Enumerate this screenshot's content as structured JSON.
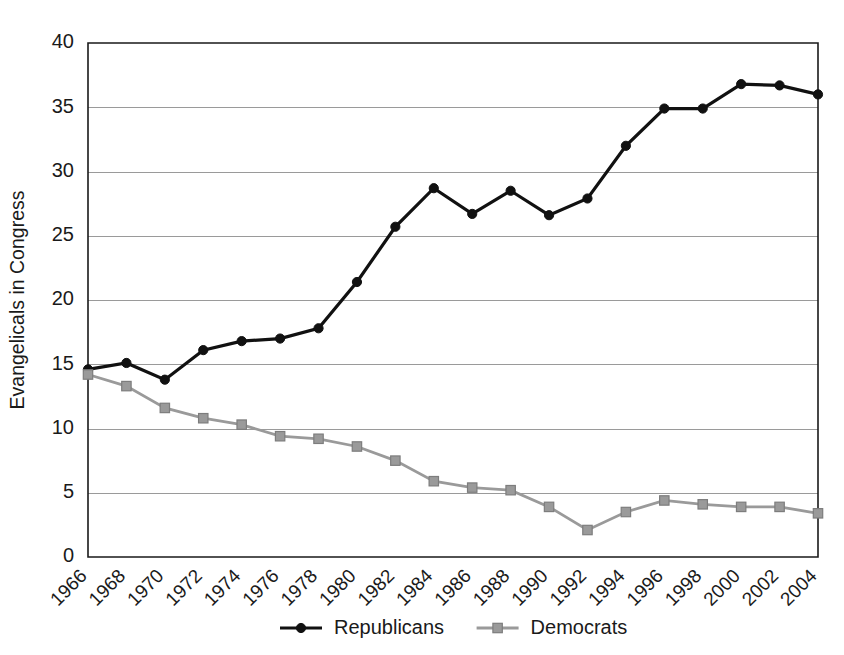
{
  "chart_data": {
    "type": "line",
    "title": "",
    "xlabel": "",
    "ylabel": "Evangelicals in Congress",
    "ylim": [
      0,
      40
    ],
    "ytick_step": 5,
    "yticks": [
      0,
      5,
      10,
      15,
      20,
      25,
      30,
      35,
      40
    ],
    "grid": "horizontal",
    "legend_position": "bottom-center",
    "categories": [
      "1966",
      "1968",
      "1970",
      "1972",
      "1974",
      "1976",
      "1978",
      "1980",
      "1982",
      "1984",
      "1986",
      "1988",
      "1990",
      "1992",
      "1994",
      "1996",
      "1998",
      "2000",
      "2002",
      "2004"
    ],
    "series": [
      {
        "name": "Republicans",
        "color": "#111111",
        "marker": "circle",
        "values": [
          14.6,
          15.1,
          13.8,
          16.1,
          16.8,
          17.0,
          17.8,
          21.4,
          25.7,
          28.7,
          26.7,
          28.5,
          26.6,
          27.9,
          32.0,
          34.9,
          34.9,
          36.8,
          36.7,
          36.0
        ]
      },
      {
        "name": "Democrats",
        "color": "#9a9a9a",
        "marker": "square",
        "values": [
          14.2,
          13.3,
          11.6,
          10.8,
          10.3,
          9.4,
          9.2,
          8.6,
          7.5,
          5.9,
          5.4,
          5.2,
          3.9,
          2.1,
          3.5,
          4.4,
          4.1,
          3.9,
          3.9,
          3.4
        ]
      }
    ]
  },
  "legend": {
    "items": [
      {
        "label": "Republicans",
        "color": "#111111",
        "marker": "circle"
      },
      {
        "label": "Democrats",
        "color": "#9a9a9a",
        "marker": "square"
      }
    ]
  },
  "colors": {
    "republican": "#111111",
    "democrat": "#9a9a9a",
    "axis": "#1a1a1a",
    "grid": "#9a9a9a",
    "background": "#ffffff"
  }
}
